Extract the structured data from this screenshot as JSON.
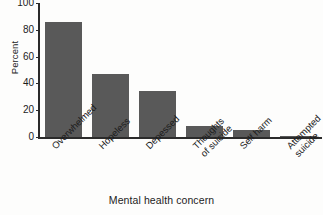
{
  "chart_data": {
    "type": "bar",
    "title": "",
    "xlabel": "Mental health concern",
    "ylabel": "Percent",
    "categories": [
      "Overwhelmed",
      "Hopeless",
      "Depessed",
      "Thoughts\nof suicide",
      "Self harm",
      "Attempted\nsuicide"
    ],
    "values": [
      86,
      47,
      34,
      8,
      5,
      1
    ],
    "ylim": [
      0,
      100
    ],
    "yticks": [
      0,
      20,
      40,
      60,
      80,
      100
    ],
    "ytick_labels": [
      "0",
      "20",
      "40",
      "60",
      "80",
      "100"
    ],
    "grid": false,
    "legend": false,
    "bar_color": "#595959",
    "axis_color": "#2b2b2b",
    "background_color": "#fdfdfc",
    "xtick_label_rotation": -45
  },
  "axes": {
    "y_title": "Percent",
    "x_title": "Mental health concern"
  },
  "bars": [
    {
      "label": "Overwhelmed",
      "value": 86
    },
    {
      "label": "Hopeless",
      "value": 47
    },
    {
      "label": "Depessed",
      "value": 34
    },
    {
      "label": "Thoughts of suicide",
      "value": 8
    },
    {
      "label": "Self harm",
      "value": 5
    },
    {
      "label": "Attempted suicide",
      "value": 1
    }
  ],
  "xtick_lines": [
    {
      "line1": "Overwhelmed",
      "line2": ""
    },
    {
      "line1": "Hopeless",
      "line2": ""
    },
    {
      "line1": "Depessed",
      "line2": ""
    },
    {
      "line1": "Thoughts",
      "line2": "of suicide"
    },
    {
      "line1": "Self harm",
      "line2": ""
    },
    {
      "line1": "Attempted",
      "line2": "suicide"
    }
  ]
}
